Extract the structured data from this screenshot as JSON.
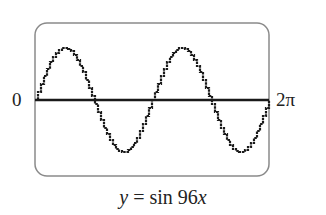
{
  "chart_data": {
    "type": "line",
    "title": "",
    "caption": "y = sin 96x",
    "caption_parts": {
      "var": "y",
      "eq": " = sin 96",
      "x": "x"
    },
    "xlabel": "",
    "ylabel": "",
    "x_tick_labels": {
      "left": "0",
      "right": "2π"
    },
    "xlim": [
      0,
      6.2832
    ],
    "ylim": [
      -1.15,
      1.15
    ],
    "grid": false,
    "series": [
      {
        "name": "y = sin 96x (as displayed, aliased to 2 periods)",
        "periods_visible": 2,
        "x": [
          0,
          0.785,
          1.571,
          2.356,
          3.142,
          3.927,
          4.712,
          5.498,
          6.283
        ],
        "values": [
          0,
          1,
          0,
          -1,
          0,
          1,
          0,
          -1,
          0
        ]
      }
    ],
    "colors": {
      "curve": "#1a1a1a",
      "axis": "#1a1a1a",
      "frame": "#8a8a8a"
    }
  },
  "labels": {
    "left": "0",
    "right": "2π"
  }
}
